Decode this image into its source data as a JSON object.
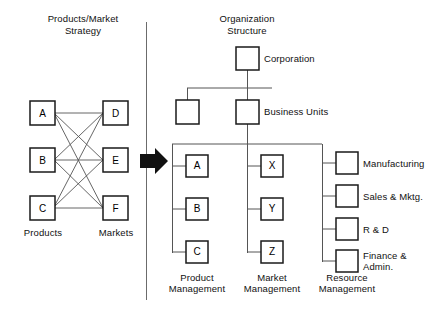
{
  "diagram": {
    "title_left": "Products/Market\nStrategy",
    "title_right": "Organization\nStructure",
    "transform_arrow": "right-arrow",
    "left_panel": {
      "column_label_products": "Products",
      "column_label_markets": "Markets",
      "product_nodes": [
        {
          "id": "A",
          "label": "A",
          "x": 42,
          "y": 113
        },
        {
          "id": "B",
          "label": "B",
          "x": 42,
          "y": 160
        },
        {
          "id": "C",
          "label": "C",
          "x": 42,
          "y": 208
        }
      ],
      "market_nodes": [
        {
          "id": "D",
          "label": "D",
          "x": 116,
          "y": 113
        },
        {
          "id": "E",
          "label": "E",
          "x": 116,
          "y": 160
        },
        {
          "id": "F",
          "label": "F",
          "x": 116,
          "y": 208
        }
      ],
      "links": [
        {
          "from": "A",
          "to": "D"
        },
        {
          "from": "A",
          "to": "E"
        },
        {
          "from": "A",
          "to": "F"
        },
        {
          "from": "B",
          "to": "D"
        },
        {
          "from": "B",
          "to": "E"
        },
        {
          "from": "B",
          "to": "F"
        },
        {
          "from": "C",
          "to": "D"
        },
        {
          "from": "C",
          "to": "E"
        },
        {
          "from": "C",
          "to": "F"
        }
      ]
    },
    "right_panel": {
      "corporation_label": "Corporation",
      "business_units_label": "Business Units",
      "product_management_label": "Product\nManagement",
      "market_management_label": "Market\nManagement",
      "resource_management_label": "Resource\nManagement",
      "product_nodes": [
        {
          "label": "A"
        },
        {
          "label": "B"
        },
        {
          "label": "C"
        }
      ],
      "market_nodes": [
        {
          "label": "X"
        },
        {
          "label": "Y"
        },
        {
          "label": "Z"
        }
      ],
      "resource_nodes": [
        {
          "label": "Manufacturing"
        },
        {
          "label": "Sales & Mktg."
        },
        {
          "label": "R & D"
        },
        {
          "label": "Finance &\nAdmin."
        }
      ]
    },
    "colors": {
      "ink": "#000000",
      "line": "#4d4d4d",
      "box_border": "#1a1a1a",
      "background": "#ffffff"
    }
  }
}
